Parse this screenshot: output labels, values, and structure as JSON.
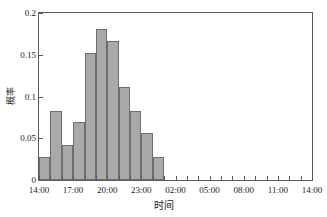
{
  "chart_data": {
    "type": "bar",
    "title": "",
    "xlabel": "时间",
    "ylabel": "概率",
    "xlim": [
      0,
      24
    ],
    "ylim": [
      0,
      0.2
    ],
    "grid": false,
    "legend": null,
    "bar_width_hours": 1,
    "x_start_hour_label": "14:00",
    "categories": [
      "14:00",
      "15:00",
      "16:00",
      "17:00",
      "18:00",
      "19:00",
      "20:00",
      "21:00",
      "22:00",
      "23:00",
      "00:00"
    ],
    "values": [
      0.027,
      0.083,
      0.042,
      0.069,
      0.152,
      0.181,
      0.166,
      0.111,
      0.083,
      0.056,
      0.028
    ],
    "x_tick_labels": [
      "14:00",
      "17:00",
      "20:00",
      "23:00",
      "02:00",
      "05:00",
      "08:00",
      "11:00",
      "14:00"
    ],
    "x_tick_hours": [
      0,
      3,
      6,
      9,
      12,
      15,
      18,
      21,
      24
    ],
    "x_minor_tick_hours": [
      1,
      2,
      4,
      5,
      7,
      8,
      10,
      11,
      13,
      14,
      16,
      17,
      19,
      20,
      22,
      23
    ],
    "y_tick_labels": [
      "0",
      "0.05",
      "0.1",
      "0.15",
      "0.2"
    ],
    "y_tick_values": [
      0,
      0.05,
      0.1,
      0.15,
      0.2
    ],
    "colors": {
      "bar_fill": "#a9a9a9",
      "bar_edge": "#6e6e6e",
      "axis": "#5a5a5a",
      "text": "#1a1a1a",
      "background": "#ffffff"
    }
  }
}
